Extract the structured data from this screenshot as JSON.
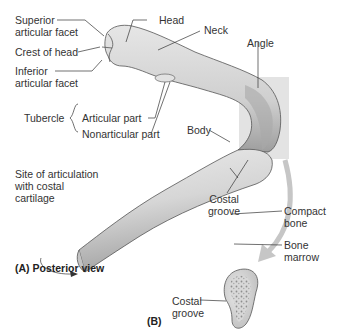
{
  "figure": {
    "view_a_caption": "(A) Posterior view",
    "view_b_caption": "(B)",
    "colors": {
      "bone_fill": "#d9d9d9",
      "bone_shade": "#a8a8a8",
      "highlight_box": "#c8c8c8",
      "arrow": "#c6c6c6",
      "leader_line": "#333333",
      "text": "#333333"
    }
  },
  "labels_a": {
    "superior_articular_facet": [
      "Superior",
      "articular facet"
    ],
    "crest_of_head": "Crest of head",
    "inferior_articular_facet": [
      "Inferior",
      "articular facet"
    ],
    "head": "Head",
    "neck": "Neck",
    "angle": "Angle",
    "tubercle": "Tubercle",
    "articular_part": "Articular part",
    "nonarticular_part": "Nonarticular part",
    "body": "Body",
    "costal_groove": [
      "Costal",
      "groove"
    ],
    "site_of_articulation": [
      "Site of articulation",
      "with costal",
      "cartilage"
    ]
  },
  "labels_b": {
    "compact_bone": [
      "Compact",
      "bone"
    ],
    "bone_marrow": [
      "Bone",
      "marrow"
    ],
    "costal_groove": [
      "Costal",
      "groove"
    ]
  }
}
